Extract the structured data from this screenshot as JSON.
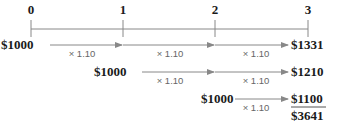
{
  "timeline": {
    "periods": [
      "0",
      "1",
      "2",
      "3"
    ]
  },
  "rows": [
    {
      "start": "$1000",
      "end": "$1331",
      "multipliers": [
        "× 1.10",
        "× 1.10",
        "× 1.10"
      ]
    },
    {
      "start": "$1000",
      "end": "$1210",
      "multipliers": [
        "× 1.10",
        "× 1.10"
      ]
    },
    {
      "start": "$1000",
      "end": "$1100",
      "multipliers": [
        "× 1.10"
      ]
    }
  ],
  "total": "$3641",
  "colors": {
    "line": "#888888",
    "text": "#1a1a1a",
    "multiplier": "#666666"
  }
}
